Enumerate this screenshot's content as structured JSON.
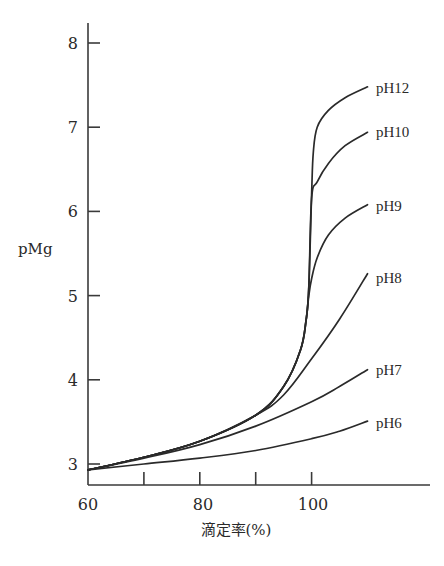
{
  "chart_data": {
    "type": "line",
    "title": "",
    "xlabel": "滴定率(%)",
    "ylabel": "pMg",
    "xlim": [
      60,
      118
    ],
    "ylim": [
      2.75,
      8.25
    ],
    "x_ticks": [
      60,
      70,
      80,
      90,
      100
    ],
    "x_tick_labels": [
      "60",
      "",
      "80",
      "",
      "100"
    ],
    "y_ticks": [
      3,
      4,
      5,
      6,
      7,
      8
    ],
    "y_tick_labels": [
      "3",
      "4",
      "5",
      "6",
      "7",
      "8"
    ],
    "grid": false,
    "legend_position": "inline-right-of-curve-ends",
    "series": [
      {
        "name": "pH12",
        "x": [
          60,
          70,
          80,
          90,
          95,
          98,
          99,
          99.5,
          100,
          100.3,
          101,
          103,
          106,
          110
        ],
        "y": [
          2.93,
          3.08,
          3.27,
          3.58,
          3.92,
          4.35,
          4.7,
          5.1,
          6.2,
          6.7,
          7.0,
          7.2,
          7.35,
          7.48
        ]
      },
      {
        "name": "pH10",
        "x": [
          60,
          70,
          80,
          90,
          95,
          98,
          99,
          99.5,
          100,
          101,
          103,
          106,
          110
        ],
        "y": [
          2.93,
          3.08,
          3.27,
          3.58,
          3.92,
          4.35,
          4.7,
          5.1,
          6.15,
          6.35,
          6.57,
          6.78,
          6.94
        ]
      },
      {
        "name": "pH9",
        "x": [
          60,
          70,
          80,
          90,
          95,
          98,
          99,
          99.5,
          100,
          101,
          103,
          106,
          110
        ],
        "y": [
          2.93,
          3.08,
          3.27,
          3.58,
          3.92,
          4.35,
          4.7,
          5.0,
          5.2,
          5.45,
          5.72,
          5.92,
          6.08
        ]
      },
      {
        "name": "pH8",
        "x": [
          60,
          70,
          80,
          90,
          95,
          100,
          105,
          110
        ],
        "y": [
          2.93,
          3.08,
          3.27,
          3.58,
          3.82,
          4.25,
          4.72,
          5.26
        ]
      },
      {
        "name": "pH7",
        "x": [
          60,
          70,
          80,
          90,
          100,
          105,
          110
        ],
        "y": [
          2.93,
          3.07,
          3.23,
          3.45,
          3.74,
          3.92,
          4.12
        ]
      },
      {
        "name": "pH6",
        "x": [
          60,
          70,
          80,
          90,
          100,
          105,
          110
        ],
        "y": [
          2.93,
          3.0,
          3.07,
          3.16,
          3.3,
          3.39,
          3.51
        ]
      }
    ]
  },
  "labels": {
    "y_axis_title": "pMg",
    "x_axis_title": "滴定率(%)",
    "y_ticks": [
      "3",
      "4",
      "5",
      "6",
      "7",
      "8"
    ],
    "x_ticks": [
      "60",
      "80",
      "100"
    ],
    "series": [
      "pH12",
      "pH10",
      "pH9",
      "pH8",
      "pH7",
      "pH6"
    ]
  }
}
